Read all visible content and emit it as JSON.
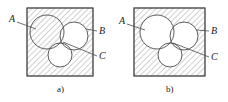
{
  "figure": {
    "type": "engineering-section-diagram",
    "stroke_color": "#4a4a4a",
    "hatch_color": "#9a9a9a",
    "text_color": "#1a1a1a",
    "fill_white": "#ffffff",
    "hatch_angle_deg": 45,
    "hatch_spacing_px": 4
  },
  "panels": [
    {
      "id": "a",
      "caption": "a)",
      "caption_x": 57,
      "caption_y": 92,
      "box": {
        "x": 27,
        "y": 8,
        "w": 66,
        "h": 68,
        "hatched": true
      },
      "circles": [
        {
          "name": "A",
          "cx": 47,
          "cy": 32,
          "r": 17,
          "hatched": true
        },
        {
          "name": "B",
          "cx": 74,
          "cy": 36,
          "r": 14,
          "hatched": false
        },
        {
          "name": "C",
          "cx": 60,
          "cy": 55,
          "r": 12,
          "hatched": false
        }
      ],
      "labels": [
        {
          "text": "A",
          "x": 9,
          "y": 22,
          "leader": {
            "x1": 17,
            "y1": 22,
            "x2": 36,
            "y2": 29
          }
        },
        {
          "text": "B",
          "x": 99,
          "y": 34,
          "leader": {
            "x1": 97,
            "y1": 31,
            "x2": 86,
            "y2": 29
          }
        },
        {
          "text": "C",
          "x": 99,
          "y": 59,
          "leader": {
            "x1": 97,
            "y1": 56,
            "x2": 63,
            "y2": 42
          }
        }
      ]
    },
    {
      "id": "b",
      "caption": "b)",
      "caption_x": 166,
      "caption_y": 92,
      "box": {
        "x": 134,
        "y": 8,
        "w": 71,
        "h": 68,
        "hatched": true
      },
      "circles": [
        {
          "name": "A",
          "cx": 157,
          "cy": 32,
          "r": 17,
          "hatched": false
        },
        {
          "name": "B",
          "cx": 184,
          "cy": 36,
          "r": 14,
          "hatched": false
        },
        {
          "name": "C",
          "cx": 170,
          "cy": 55,
          "r": 12,
          "hatched": false
        }
      ],
      "labels": [
        {
          "text": "A",
          "x": 119,
          "y": 24,
          "leader": {
            "x1": 127,
            "y1": 24,
            "x2": 145,
            "y2": 30
          }
        },
        {
          "text": "B",
          "x": 211,
          "y": 34,
          "leader": {
            "x1": 209,
            "y1": 31,
            "x2": 196,
            "y2": 30
          }
        },
        {
          "text": "C",
          "x": 211,
          "y": 60,
          "leader": {
            "x1": 209,
            "y1": 57,
            "x2": 173,
            "y2": 43
          }
        }
      ]
    }
  ]
}
